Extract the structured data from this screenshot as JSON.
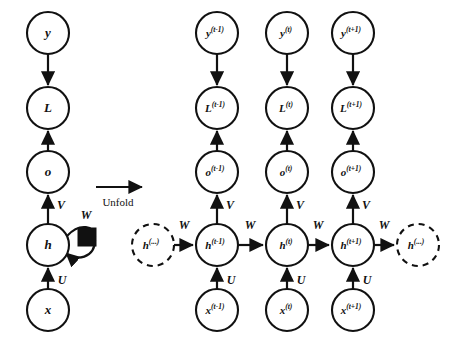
{
  "figure": {
    "type": "diagram",
    "background_color": "#ffffff",
    "ink_color": "#111111"
  },
  "transition": {
    "label": "Unfold",
    "arrow_direction": "right"
  },
  "folded_graph": {
    "name": "folded-rnn",
    "center_x": 48,
    "node_radius": 21,
    "nodes": [
      {
        "id": "y",
        "label": "y",
        "cx": 48,
        "cy": 33,
        "style": "solid"
      },
      {
        "id": "L",
        "label": "L",
        "cx": 48,
        "cy": 108,
        "style": "solid"
      },
      {
        "id": "o",
        "label": "o",
        "cx": 48,
        "cy": 172,
        "style": "solid"
      },
      {
        "id": "h",
        "label": "h",
        "cx": 48,
        "cy": 245,
        "style": "solid"
      },
      {
        "id": "x",
        "label": "x",
        "cx": 48,
        "cy": 310,
        "style": "solid"
      }
    ],
    "edges": [
      {
        "from": "y",
        "to": "L",
        "direction": "down",
        "weight": ""
      },
      {
        "from": "o",
        "to": "L",
        "direction": "up",
        "weight": ""
      },
      {
        "from": "h",
        "to": "o",
        "direction": "up",
        "weight": "V"
      },
      {
        "from": "x",
        "to": "h",
        "direction": "up",
        "weight": "U"
      },
      {
        "from": "h",
        "to": "h",
        "direction": "self-loop",
        "weight": "W"
      }
    ],
    "weights": {
      "V": "V",
      "U": "U",
      "W": "W"
    },
    "delay_node": {
      "shape": "filled-square",
      "cx": 87,
      "cy": 237,
      "size": 18
    }
  },
  "unfolded_graph": {
    "name": "unfolded-rnn",
    "node_radius": 21,
    "rows": {
      "y": 33,
      "L": 108,
      "o": 172,
      "h": 245,
      "x": 310
    },
    "timesteps": [
      {
        "key": "t_minus_1",
        "column_x": 217,
        "superscript": "(t-1)",
        "nodes": {
          "y": "y",
          "L": "L",
          "o": "o",
          "h": "h",
          "x": "x"
        }
      },
      {
        "key": "t",
        "column_x": 287,
        "superscript": "(t)",
        "nodes": {
          "y": "y",
          "L": "L",
          "o": "o",
          "h": "h",
          "x": "x"
        }
      },
      {
        "key": "t_plus_1",
        "column_x": 353,
        "superscript": "(t+1)",
        "nodes": {
          "y": "y",
          "L": "L",
          "o": "o",
          "h": "h",
          "x": "x"
        }
      }
    ],
    "ellipsis_nodes": [
      {
        "key": "h_prev_ellipsis",
        "label": "h",
        "superscript": "(...)",
        "cx": 153,
        "cy": 245,
        "style": "dashed"
      },
      {
        "key": "h_next_ellipsis",
        "label": "h",
        "superscript": "(...)",
        "cx": 418,
        "cy": 245,
        "style": "dashed"
      }
    ],
    "weights": {
      "V": "V",
      "U": "U",
      "W": "W"
    },
    "recurrent_edges": [
      {
        "from": "h_prev_ellipsis",
        "to": "t_minus_1",
        "weight": "W"
      },
      {
        "from": "t_minus_1",
        "to": "t",
        "weight": "W"
      },
      {
        "from": "t",
        "to": "t_plus_1",
        "weight": "W"
      },
      {
        "from": "t_plus_1",
        "to": "h_next_ellipsis",
        "weight": "W"
      }
    ],
    "vertical_edges": [
      {
        "from": "x",
        "to": "h",
        "weight": "U",
        "direction": "up"
      },
      {
        "from": "h",
        "to": "o",
        "weight": "V",
        "direction": "up"
      },
      {
        "from": "o",
        "to": "L",
        "weight": "",
        "direction": "up"
      },
      {
        "from": "y",
        "to": "L",
        "weight": "",
        "direction": "down"
      }
    ]
  }
}
